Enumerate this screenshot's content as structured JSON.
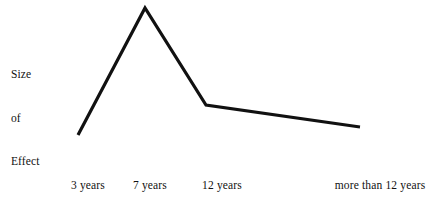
{
  "chart_data": {
    "type": "line",
    "title": "",
    "subtitle": "",
    "xlabel": "",
    "ylabel": "Size of Effect",
    "ylabel_lines": [
      "Size",
      "of",
      "Effect"
    ],
    "categories": [
      "3 years",
      "7 years",
      "12 years",
      "more than 12 years"
    ],
    "values": [
      1.0,
      4.8,
      1.9,
      1.4
    ],
    "series": [
      {
        "name": "Size of Effect",
        "values": [
          1.0,
          4.8,
          1.9,
          1.4
        ]
      }
    ],
    "points": [
      {
        "label": "3 years",
        "x": 78,
        "y": 135,
        "value": 1.0
      },
      {
        "label": "7 years",
        "x": 145,
        "y": 8,
        "value": 4.8
      },
      {
        "label": "12 years",
        "x": 206,
        "y": 105,
        "value": 1.9
      },
      {
        "label": "more than 12 years",
        "x": 360,
        "y": 127,
        "value": 1.4
      }
    ],
    "polyline": "78,135 145,8 206,105 360,127",
    "line_color": "#111111",
    "line_width": 3.2,
    "grid": false,
    "legend": false,
    "legend_position": "none",
    "axes_visible": false,
    "ylim": [
      0,
      5
    ],
    "xlim": [
      0,
      3
    ],
    "annotations": []
  },
  "axis": {
    "y_label_lines": [
      "Size",
      "of",
      "Effect"
    ],
    "x_tick_labels": [
      {
        "text": "3 years",
        "center_x": 88
      },
      {
        "text": "7 years",
        "center_x": 150
      },
      {
        "text": "12 years",
        "center_x": 222
      },
      {
        "text": "more than 12 years",
        "center_x": 380
      }
    ]
  },
  "colors": {
    "background": "#ffffff",
    "ink": "#111111",
    "line": "#111111"
  }
}
